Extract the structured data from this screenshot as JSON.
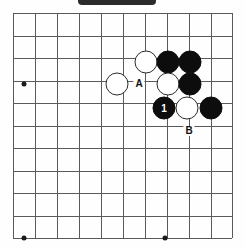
{
  "figure": {
    "kind": "go-board-diagram",
    "title_bar": {
      "present": true,
      "color": "#2b2b2b"
    },
    "board": {
      "line_color": "#5a5a5a",
      "left": 13,
      "top": 13,
      "right": 232,
      "bottom": 238,
      "columns": 11,
      "rows": 11,
      "col_x": [
        13,
        35,
        57,
        79,
        101,
        123,
        145,
        167,
        189,
        211,
        232
      ],
      "row_y": [
        13,
        35.5,
        58,
        80.5,
        103,
        125.5,
        148,
        170.5,
        193,
        215.5,
        238
      ],
      "star_points": [
        {
          "x": 24,
          "y": 84
        },
        {
          "x": 24,
          "y": 238
        },
        {
          "x": 165,
          "y": 238
        }
      ]
    },
    "stones": [
      {
        "id": "w1",
        "color": "white",
        "x": 117,
        "y": 84,
        "label": ""
      },
      {
        "id": "w2",
        "color": "white",
        "x": 146,
        "y": 62,
        "label": ""
      },
      {
        "id": "b1",
        "color": "black",
        "x": 168,
        "y": 62,
        "label": ""
      },
      {
        "id": "b2",
        "color": "black",
        "x": 190,
        "y": 62,
        "label": ""
      },
      {
        "id": "w3",
        "color": "white",
        "x": 168,
        "y": 84,
        "label": ""
      },
      {
        "id": "b3",
        "color": "black",
        "x": 190,
        "y": 84,
        "label": ""
      },
      {
        "id": "b4",
        "color": "black",
        "x": 164,
        "y": 108,
        "label": "1"
      },
      {
        "id": "w4",
        "color": "white",
        "x": 187,
        "y": 108,
        "label": ""
      },
      {
        "id": "b5",
        "color": "black",
        "x": 211,
        "y": 108,
        "label": ""
      }
    ],
    "markers": [
      {
        "id": "m-a",
        "text": "A",
        "x": 139,
        "y": 84
      },
      {
        "id": "m-b",
        "text": "B",
        "x": 189,
        "y": 131
      }
    ]
  }
}
